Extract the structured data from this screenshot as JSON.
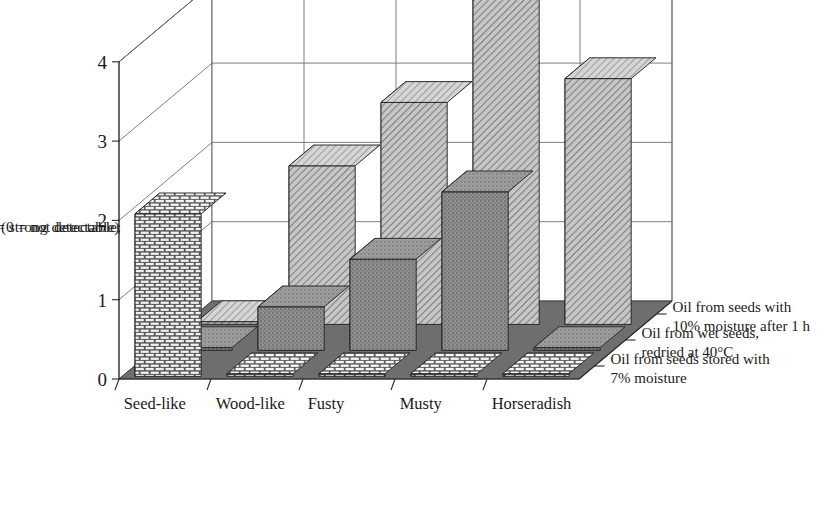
{
  "chart_data": {
    "type": "bar",
    "subtype": "3d-grouped-bar",
    "title": "",
    "xlabel": "",
    "ylabel": "Intensity (0 = not detectable; 5 = strong detectable)",
    "ylabel_lines": [
      "Intensity (0 = not detectable;",
      "5 = strong detectable)"
    ],
    "categories": [
      "Seed-like",
      "Wood-like",
      "Fusty",
      "Musty",
      "Horseradish"
    ],
    "ylim": [
      0,
      4
    ],
    "yticks": [
      0,
      1,
      2,
      3,
      4
    ],
    "ytick_labels": [
      "0",
      "1",
      "2",
      "3",
      "4"
    ],
    "grid": true,
    "legend_position": "right-depth-axis",
    "series": [
      {
        "name": "Oil from seeds with 10% moisture after 1 h",
        "label_lines": [
          "Oil from seeds with",
          "10% moisture after 1 h"
        ],
        "pattern": "diagonal-hatch",
        "color": "#b9b9b9",
        "values": [
          0,
          2.0,
          2.8,
          4.1,
          3.1
        ]
      },
      {
        "name": "Oil from wet seeds, redried at 40°C",
        "label_lines": [
          "Oil from wet seeds,",
          "redried at 40°C"
        ],
        "pattern": "stipple",
        "color": "#8a8a8a",
        "values": [
          0,
          0.55,
          1.15,
          2.0,
          0
        ]
      },
      {
        "name": "Oil from seeds stored with 7% moisture",
        "label_lines": [
          "Oil from seeds stored with",
          "7% moisture"
        ],
        "pattern": "brick",
        "color": "#d0d0d0",
        "values": [
          2.05,
          0,
          0,
          0,
          0
        ]
      }
    ]
  },
  "colors": {
    "floor": "#6e6e6e",
    "wall": "#ffffff",
    "axis": "#2b2b2b",
    "grid": "#6f6f6f",
    "ink": "#1a1a1a"
  }
}
